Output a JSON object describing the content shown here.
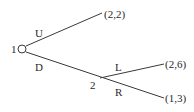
{
  "game_tree": {
    "nodes": [
      {
        "id": "n1",
        "player_label": "1"
      },
      {
        "id": "n2",
        "player_label": "2"
      }
    ],
    "edges": [
      {
        "id": "U",
        "from": "n1",
        "action_label": "U",
        "payoff": "(2,2)"
      },
      {
        "id": "D",
        "from": "n1",
        "to": "n2",
        "action_label": "D"
      },
      {
        "id": "L",
        "from": "n2",
        "action_label": "L",
        "payoff": "(2,6)"
      },
      {
        "id": "R",
        "from": "n2",
        "action_label": "R",
        "payoff": "(1,3)"
      }
    ]
  }
}
